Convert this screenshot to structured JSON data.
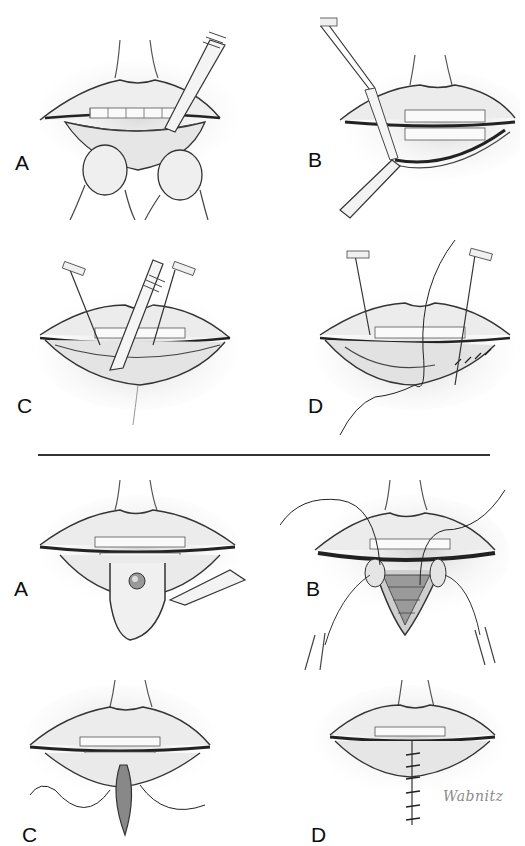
{
  "figure": {
    "type": "surgical-illustration",
    "style": "pencil drawing, grayscale",
    "background": "#ffffff",
    "ink": "#1a1a1a",
    "sections": [
      {
        "id": "top",
        "panels": [
          {
            "label": "A",
            "description": "Lower lip everted by fingers; scalpel making incision along vermilion border"
          },
          {
            "label": "B",
            "description": "Forceps and scalpel lifting strip of vermilion mucosa from lower lip"
          },
          {
            "label": "C",
            "description": "Two hook retractors holding lip; scalpel undermining labial mucosa"
          },
          {
            "label": "D",
            "description": "Mucosal flap advanced with retractors; running suture closing vermilion margin"
          }
        ]
      },
      {
        "id": "bottom",
        "panels": [
          {
            "label": "A",
            "description": "Lesion on lower lip outlined with V/shield-shaped excision; scalpel incising"
          },
          {
            "label": "B",
            "description": "Wedge excision opened with retraction sutures; layered closure beginning"
          },
          {
            "label": "C",
            "description": "Wedge being approximated with sutures; excised tissue hanging below"
          },
          {
            "label": "D",
            "description": "Completed vertical closure of lower lip with interrupted sutures"
          }
        ]
      }
    ],
    "signature": "Wabnitz"
  }
}
